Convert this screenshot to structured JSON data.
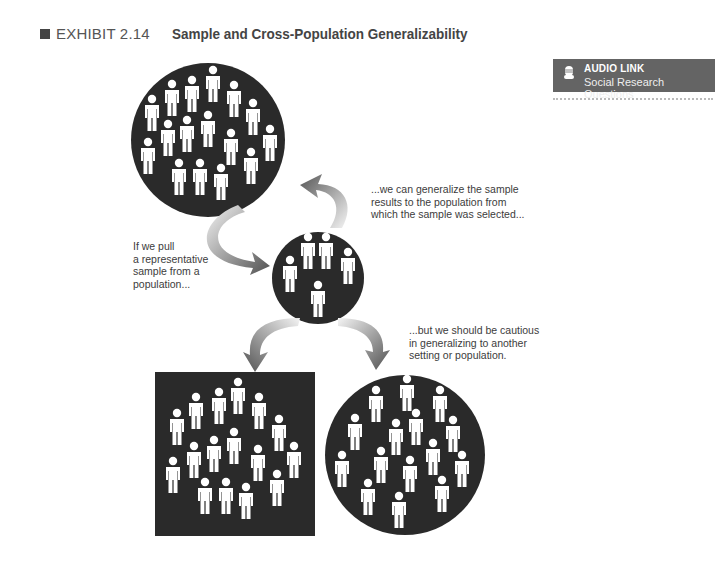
{
  "header": {
    "exhibit_label": "EXHIBIT 2.14",
    "title": "Sample and Cross-Population Generalizability"
  },
  "audio_link": {
    "icon": "microphone-icon",
    "title": "AUDIO LINK",
    "subtitle": "Social Research Questions",
    "background": "#646464"
  },
  "captions": {
    "pull_sample": [
      "If we pull",
      "a representative",
      "sample from a",
      "population..."
    ],
    "generalize_back": [
      "...we can generalize the sample",
      "results to the population from",
      "which the sample was selected..."
    ],
    "cautious": [
      "...but we should be cautious",
      "in generalizing to another",
      "setting or population."
    ]
  },
  "diagram": {
    "nodes": [
      {
        "id": "population",
        "shape": "circle",
        "people": 18
      },
      {
        "id": "sample",
        "shape": "circle",
        "people": 6
      },
      {
        "id": "other-setting",
        "shape": "square",
        "people": 18
      },
      {
        "id": "other-population",
        "shape": "circle",
        "people": 18
      }
    ],
    "colors": {
      "fill": "#2a2a2a",
      "figure": "#ffffff",
      "arrow_dark": "#555555",
      "arrow_light": "#f2f2f2"
    }
  }
}
